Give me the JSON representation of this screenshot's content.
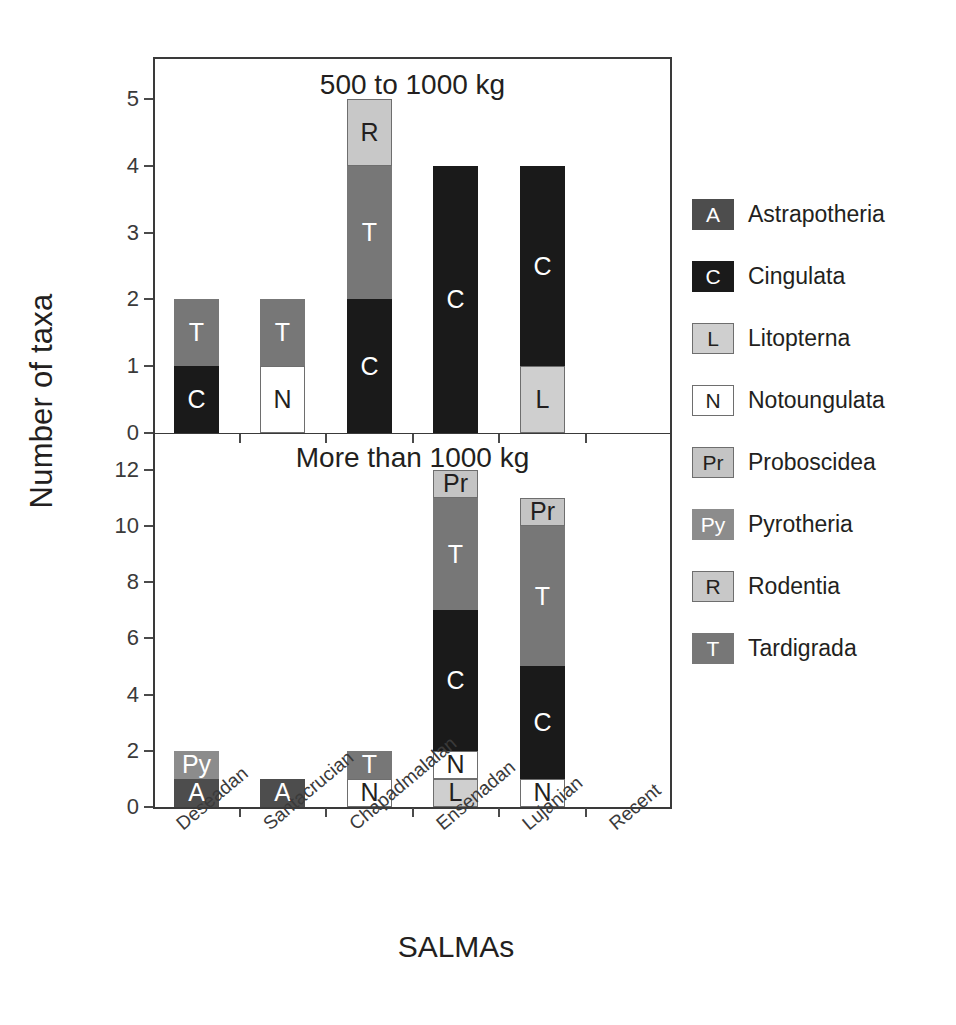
{
  "figure": {
    "ylabel": "Number of taxa",
    "xlabel": "SALMAs"
  },
  "panels": [
    {
      "id": "top",
      "title": "500 to 1000 kg",
      "ymax": 5,
      "yticks": [
        "0",
        "1",
        "2",
        "3",
        "4",
        "5"
      ]
    },
    {
      "id": "bottom",
      "title": "More than 1000 kg",
      "ymax": 13,
      "yticks": [
        "0",
        "2",
        "4",
        "6",
        "8",
        "10",
        "12"
      ]
    }
  ],
  "categories": [
    "Deseadan",
    "Santacrucian",
    "Chapadmalalan",
    "Ensenadan",
    "Lujanian",
    "Recent"
  ],
  "legend": [
    {
      "code": "A",
      "name": "Astrapotheria",
      "color": "#4d4d4d",
      "text": "#ffffff",
      "border": false
    },
    {
      "code": "C",
      "name": "Cingulata",
      "color": "#1a1a1a",
      "text": "#ffffff",
      "border": false
    },
    {
      "code": "L",
      "name": "Litopterna",
      "color": "#cfcfcf",
      "text": "#231f20",
      "border": true
    },
    {
      "code": "N",
      "name": "Notoungulata",
      "color": "#ffffff",
      "text": "#231f20",
      "border": true
    },
    {
      "code": "Pr",
      "name": "Proboscidea",
      "color": "#c4c4c4",
      "text": "#231f20",
      "border": true
    },
    {
      "code": "Py",
      "name": "Pyrotheria",
      "color": "#8c8c8c",
      "text": "#ffffff",
      "border": false
    },
    {
      "code": "R",
      "name": "Rodentia",
      "color": "#c8c8c8",
      "text": "#231f20",
      "border": true
    },
    {
      "code": "T",
      "name": "Tardigrada",
      "color": "#777777",
      "text": "#ffffff",
      "border": false
    }
  ],
  "chart_data": {
    "type": "bar",
    "subtype": "stacked-bar",
    "xlabel": "SALMAs",
    "ylabel": "Number of taxa",
    "grid": false,
    "legend_position": "right",
    "categories": [
      "Deseadan",
      "Santacrucian",
      "Chapadmalalan",
      "Ensenadan",
      "Lujanian",
      "Recent"
    ],
    "panels": [
      {
        "title": "500 to 1000 kg",
        "ylim": [
          0,
          5.6
        ],
        "yticks": [
          0,
          1,
          2,
          3,
          4,
          5
        ],
        "totals": [
          2,
          2,
          5,
          4,
          4,
          0
        ],
        "stacks": [
          {
            "category": "Deseadan",
            "segments": [
              {
                "code": "C",
                "value": 1
              },
              {
                "code": "T",
                "value": 1
              }
            ]
          },
          {
            "category": "Santacrucian",
            "segments": [
              {
                "code": "N",
                "value": 1
              },
              {
                "code": "T",
                "value": 1
              }
            ]
          },
          {
            "category": "Chapadmalalan",
            "segments": [
              {
                "code": "C",
                "value": 2
              },
              {
                "code": "T",
                "value": 2
              },
              {
                "code": "R",
                "value": 1
              }
            ]
          },
          {
            "category": "Ensenadan",
            "segments": [
              {
                "code": "C",
                "value": 4
              }
            ]
          },
          {
            "category": "Lujanian",
            "segments": [
              {
                "code": "L",
                "value": 1
              },
              {
                "code": "C",
                "value": 3
              }
            ]
          },
          {
            "category": "Recent",
            "segments": []
          }
        ]
      },
      {
        "title": "More than 1000 kg",
        "ylim": [
          0,
          13.2
        ],
        "yticks": [
          0,
          2,
          4,
          6,
          8,
          10,
          12
        ],
        "totals": [
          2,
          1,
          2,
          12,
          11,
          0
        ],
        "stacks": [
          {
            "category": "Deseadan",
            "segments": [
              {
                "code": "A",
                "value": 1
              },
              {
                "code": "Py",
                "value": 1
              }
            ]
          },
          {
            "category": "Santacrucian",
            "segments": [
              {
                "code": "A",
                "value": 1
              }
            ]
          },
          {
            "category": "Chapadmalalan",
            "segments": [
              {
                "code": "N",
                "value": 1
              },
              {
                "code": "T",
                "value": 1
              }
            ]
          },
          {
            "category": "Ensenadan",
            "segments": [
              {
                "code": "L",
                "value": 1
              },
              {
                "code": "N",
                "value": 1
              },
              {
                "code": "C",
                "value": 5
              },
              {
                "code": "T",
                "value": 4
              },
              {
                "code": "Pr",
                "value": 1
              }
            ]
          },
          {
            "category": "Lujanian",
            "segments": [
              {
                "code": "N",
                "value": 1
              },
              {
                "code": "C",
                "value": 4
              },
              {
                "code": "T",
                "value": 5
              },
              {
                "code": "Pr",
                "value": 1
              }
            ]
          },
          {
            "category": "Recent",
            "segments": []
          }
        ]
      }
    ],
    "series_key": {
      "A": "Astrapotheria",
      "C": "Cingulata",
      "L": "Litopterna",
      "N": "Notoungulata",
      "Pr": "Proboscidea",
      "Py": "Pyrotheria",
      "R": "Rodentia",
      "T": "Tardigrada"
    }
  }
}
